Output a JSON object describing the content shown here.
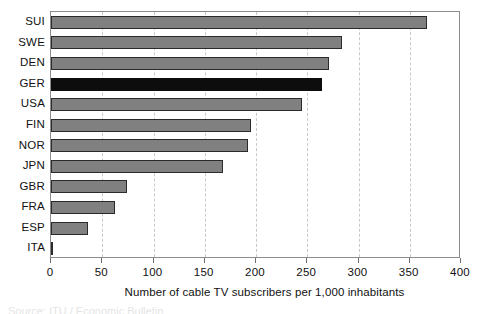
{
  "chart": {
    "axis_title": "Number of cable TV subscribers per 1,000 inhabitants",
    "colors": {
      "bar_fill": "#808080",
      "bar_border": "#2b2b2b",
      "highlight_fill": "#0d0d0d",
      "gridline": "#c9c9c9",
      "axis": "#8c8c8c",
      "text": "#111111"
    },
    "footer_remnant": "Source: ITU / Economic Bulletin"
  },
  "chart_data": {
    "type": "bar",
    "orientation": "horizontal",
    "title": "",
    "subtitle": "",
    "xlabel": "Number of cable TV subscribers per 1,000 inhabitants",
    "ylabel": "",
    "xlim": [
      0,
      400
    ],
    "xticks": [
      0,
      50,
      100,
      150,
      200,
      250,
      300,
      350,
      400
    ],
    "xtick_labels": [
      "0",
      "50",
      "100",
      "150",
      "200",
      "250",
      "300",
      "350",
      "400"
    ],
    "grid": "vertical-dashed",
    "legend": "none",
    "highlight_category": "GER",
    "categories": [
      "SUI",
      "SWE",
      "DEN",
      "GER",
      "USA",
      "FIN",
      "NOR",
      "JPN",
      "GBR",
      "FRA",
      "ESP",
      "ITA"
    ],
    "values": [
      367,
      284,
      271,
      264,
      245,
      195,
      192,
      168,
      74,
      62,
      36,
      1
    ],
    "bars": [
      {
        "category": "SUI",
        "value": 367,
        "highlighted": false
      },
      {
        "category": "SWE",
        "value": 284,
        "highlighted": false
      },
      {
        "category": "DEN",
        "value": 271,
        "highlighted": false
      },
      {
        "category": "GER",
        "value": 264,
        "highlighted": true
      },
      {
        "category": "USA",
        "value": 245,
        "highlighted": false
      },
      {
        "category": "FIN",
        "value": 195,
        "highlighted": false
      },
      {
        "category": "NOR",
        "value": 192,
        "highlighted": false
      },
      {
        "category": "JPN",
        "value": 168,
        "highlighted": false
      },
      {
        "category": "GBR",
        "value": 74,
        "highlighted": false
      },
      {
        "category": "FRA",
        "value": 62,
        "highlighted": false
      },
      {
        "category": "ESP",
        "value": 36,
        "highlighted": false
      },
      {
        "category": "ITA",
        "value": 1,
        "highlighted": false
      }
    ]
  }
}
